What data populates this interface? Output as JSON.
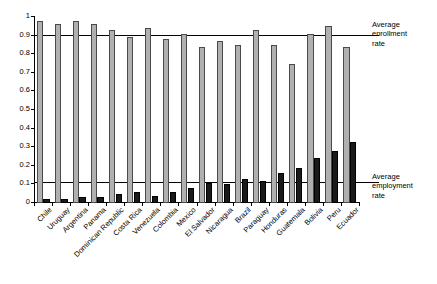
{
  "chart_data": {
    "type": "bar",
    "title": "",
    "subtitle": "",
    "xlabel": "",
    "ylabel": "",
    "ylim": [
      0,
      1
    ],
    "yticks": [
      0,
      0.1,
      0.2,
      0.3,
      0.4,
      0.5,
      0.6,
      0.7,
      0.8,
      0.9,
      1
    ],
    "ytick_labels": [
      "0",
      "0.1",
      "0.2",
      "0.3",
      "0.4",
      "0.5",
      "0.6",
      "0.7",
      "0.8",
      "0.9",
      "1"
    ],
    "grid": false,
    "legend_position": "none",
    "categories": [
      "Chile",
      "Uruguay",
      "Argentina",
      "Panama",
      "Dominican Republic",
      "Costa Rica",
      "Venezuela",
      "Colombia",
      "Mexico",
      "El Salvador",
      "Nicaragua",
      "Brazil",
      "Paraguay",
      "Honduras",
      "Guatemala",
      "Bolivia",
      "Peru",
      "Ecuador"
    ],
    "series": [
      {
        "name": "Enrollment rate",
        "color": "#b0b0b0",
        "values": [
          0.98,
          0.96,
          0.98,
          0.96,
          0.93,
          0.89,
          0.94,
          0.88,
          0.91,
          0.84,
          0.87,
          0.85,
          0.93,
          0.85,
          0.75,
          0.91,
          0.95,
          0.84
        ]
      },
      {
        "name": "Employment rate",
        "color": "#1a1a1a",
        "values": [
          0.02,
          0.02,
          0.03,
          0.03,
          0.05,
          0.06,
          0.04,
          0.06,
          0.08,
          0.11,
          0.1,
          0.13,
          0.12,
          0.16,
          0.19,
          0.24,
          0.28,
          0.33
        ]
      }
    ],
    "reference_lines": [
      {
        "name": "average-enrollment-rate",
        "value": 0.9,
        "label_line1": "Average",
        "label_line2": "enrollment",
        "label_line3": "rate"
      },
      {
        "name": "average-employment-rate",
        "value": 0.105,
        "label_line1": "Average",
        "label_line2": "employment",
        "label_line3": "rate"
      }
    ]
  }
}
